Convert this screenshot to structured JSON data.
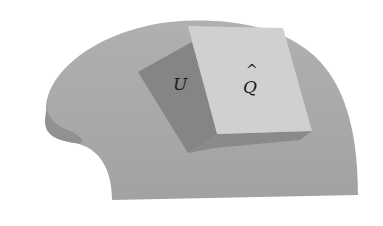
{
  "figure": {
    "labels": {
      "u": "U",
      "q": "Q",
      "q_hat": "^"
    },
    "colors": {
      "surface": "#a6a6a6",
      "surface_shadow": "#8e8e8e",
      "region_u": "#858585",
      "region_q": "#d0d0d0",
      "background": "#ffffff"
    }
  }
}
